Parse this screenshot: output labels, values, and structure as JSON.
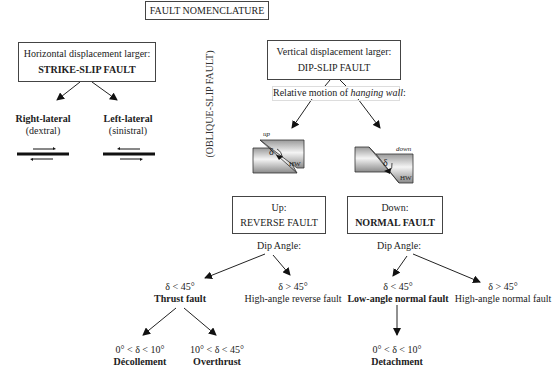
{
  "title": "FAULT NOMENCLATURE",
  "oblique_label": "(OBLIQUE-SLIP FAULT)",
  "strike_slip": {
    "line1": "Horizontal displacement larger:",
    "line2": "STRIKE-SLIP FAULT",
    "right": {
      "name": "Right-lateral",
      "alt": "(dextral)"
    },
    "left": {
      "name": "Left-lateral",
      "alt": "(sinistral)"
    }
  },
  "dip_slip": {
    "line1": "Vertical displacement larger:",
    "line2": "DIP-SLIP FAULT",
    "relative_prefix": "Relative motion of ",
    "relative_italic": "hanging wall",
    "relative_suffix": ":",
    "up_label": "up",
    "down_label": "down",
    "delta": "δ",
    "hw": "HW"
  },
  "reverse": {
    "line1": "Up:",
    "line2": "REVERSE FAULT",
    "dip": "Dip Angle:",
    "low": {
      "angle": "δ < 45°",
      "name": "Thrust fault"
    },
    "high": {
      "angle": "δ > 45°",
      "name": "High-angle reverse fault"
    },
    "sub1": {
      "angle": "0° < δ < 10°",
      "name": "Décollement"
    },
    "sub2": {
      "angle": "10° < δ < 45°",
      "name": "Overthrust"
    }
  },
  "normal": {
    "line1": "Down:",
    "line2": "NORMAL FAULT",
    "dip": "Dip Angle:",
    "low": {
      "angle": "δ < 45°",
      "name": "Low-angle normal fault"
    },
    "high": {
      "angle": "δ > 45°",
      "name": "High-angle normal fault"
    },
    "sub1": {
      "angle": "0° < δ < 10°",
      "name": "Detachment"
    }
  }
}
